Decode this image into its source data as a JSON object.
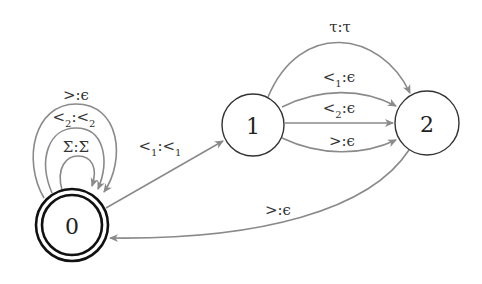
{
  "diagram": {
    "type": "finite-state-transducer",
    "colors": {
      "edge": "#8a8a8a",
      "node_stroke": "#333333",
      "accept_stroke": "#111111",
      "text": "#222222"
    },
    "nodes": [
      {
        "id": "0",
        "label": "0",
        "accepting": true
      },
      {
        "id": "1",
        "label": "1",
        "accepting": false
      },
      {
        "id": "2",
        "label": "2",
        "accepting": false
      }
    ],
    "edges": [
      {
        "from": "0",
        "to": "0",
        "label": "Σ:Σ",
        "parts": {
          "a": "Σ",
          "a_sub": "",
          "b": "Σ",
          "b_sub": ""
        }
      },
      {
        "from": "0",
        "to": "0",
        "label": "<2:<2",
        "parts": {
          "a": "<",
          "a_sub": "2",
          "b": "<",
          "b_sub": "2"
        }
      },
      {
        "from": "0",
        "to": "0",
        "label": ">:ϵ",
        "parts": {
          "a": ">",
          "a_sub": "",
          "b": "ϵ",
          "b_sub": ""
        }
      },
      {
        "from": "0",
        "to": "1",
        "label": "<1:<1",
        "parts": {
          "a": "<",
          "a_sub": "1",
          "b": "<",
          "b_sub": "1"
        }
      },
      {
        "from": "1",
        "to": "2",
        "label": "τ:τ",
        "parts": {
          "a": "τ",
          "a_sub": "",
          "b": "τ",
          "b_sub": ""
        }
      },
      {
        "from": "1",
        "to": "2",
        "label": "<1:ϵ",
        "parts": {
          "a": "<",
          "a_sub": "1",
          "b": "ϵ",
          "b_sub": ""
        }
      },
      {
        "from": "1",
        "to": "2",
        "label": "<2:ϵ",
        "parts": {
          "a": "<",
          "a_sub": "2",
          "b": "ϵ",
          "b_sub": ""
        }
      },
      {
        "from": "1",
        "to": "2",
        "label": ">:ϵ",
        "parts": {
          "a": ">",
          "a_sub": "",
          "b": "ϵ",
          "b_sub": ""
        }
      },
      {
        "from": "2",
        "to": "0",
        "label": ">:ϵ",
        "parts": {
          "a": ">",
          "a_sub": "",
          "b": "ϵ",
          "b_sub": ""
        }
      }
    ]
  }
}
